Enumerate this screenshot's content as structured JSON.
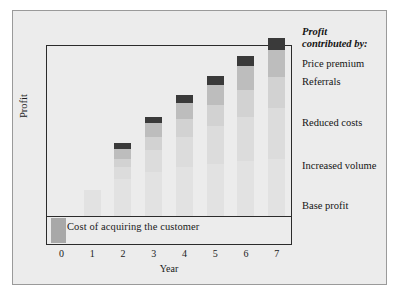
{
  "chart_data": {
    "type": "bar",
    "subtype": "stacked",
    "title": "",
    "xlabel": "Year",
    "ylabel": "Profit",
    "categories": [
      "0",
      "1",
      "2",
      "3",
      "4",
      "5",
      "6",
      "7"
    ],
    "grid": false,
    "legend_position": "right",
    "legend_title": "Profit contributed by:",
    "series": [
      {
        "name": "Base profit",
        "color": "#e2e2e2",
        "values": [
          0,
          26,
          38,
          45,
          50,
          53,
          56,
          58
        ]
      },
      {
        "name": "Increased volume",
        "color": "#dcdcdc",
        "values": [
          0,
          0,
          12,
          22,
          30,
          38,
          45,
          52
        ]
      },
      {
        "name": "Reduced costs",
        "color": "#d2d2d2",
        "values": [
          0,
          0,
          8,
          13,
          18,
          22,
          27,
          31
        ]
      },
      {
        "name": "Referrals",
        "color": "#bdbdbd",
        "values": [
          0,
          0,
          10,
          14,
          17,
          20,
          24,
          28
        ]
      },
      {
        "name": "Price premium",
        "color": "#3a3a3a",
        "values": [
          0,
          0,
          6,
          7,
          8,
          9,
          10,
          12
        ]
      }
    ],
    "annotations": [
      {
        "name": "cost-of-acquisition",
        "text": "Cost of acquiring the customer",
        "region": "below-zero-line",
        "bar_year": "0",
        "color": "#a8a8a8"
      }
    ]
  },
  "legend": {
    "title_line1": "Profit",
    "title_line2": "contributed by:",
    "items": [
      {
        "label": "Price premium",
        "top": 58
      },
      {
        "label": "Referrals",
        "top": 76
      },
      {
        "label": "Reduced costs",
        "top": 117
      },
      {
        "label": "Increased volume",
        "top": 160
      },
      {
        "label": "Base profit",
        "top": 200
      }
    ]
  },
  "axes": {
    "x_title": "Year",
    "y_title": "Profit",
    "x_ticks": [
      "0",
      "1",
      "2",
      "3",
      "4",
      "5",
      "6",
      "7"
    ]
  },
  "cost_box": {
    "label": "Cost of acquiring the customer"
  }
}
